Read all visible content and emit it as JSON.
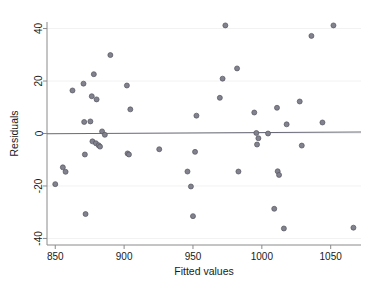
{
  "chart_data": {
    "type": "scatter",
    "title": "",
    "xlabel": "Fitted values",
    "ylabel": "Residuals",
    "xlim": [
      844,
      1072
    ],
    "ylim": [
      -42.5,
      42.5
    ],
    "xticks": [
      850,
      900,
      950,
      1000,
      1050
    ],
    "xtick_labels": [
      "850",
      "900",
      "950",
      "1000",
      "1050"
    ],
    "yticks": [
      -40,
      -20,
      0,
      20,
      40
    ],
    "ytick_labels": [
      "-40",
      "-20",
      "0",
      "20",
      "40"
    ],
    "grid": "faint horizontal gridlines at y ticks",
    "legend": "none",
    "reference_line": {
      "label": "zero residual line",
      "x_start": 844,
      "y_start": -0.1,
      "x_end": 1072,
      "y_end": 0.6
    },
    "marker_color": "#82828f",
    "marker_edge_color": "#55555f",
    "reference_line_color": "#6b6b78",
    "axis_color": "#8a8a8a",
    "background_color": "#ffffff",
    "n_points": 58,
    "points": [
      {
        "x": 850.0,
        "y": -19.3
      },
      {
        "x": 855.5,
        "y": -12.9
      },
      {
        "x": 857.5,
        "y": -14.6
      },
      {
        "x": 862.5,
        "y": 16.4
      },
      {
        "x": 870.5,
        "y": 19.0
      },
      {
        "x": 871.0,
        "y": 4.4
      },
      {
        "x": 871.5,
        "y": -8.0
      },
      {
        "x": 872.0,
        "y": -30.7
      },
      {
        "x": 875.5,
        "y": 4.6
      },
      {
        "x": 876.5,
        "y": 14.2
      },
      {
        "x": 877.0,
        "y": -3.0
      },
      {
        "x": 878.0,
        "y": 22.6
      },
      {
        "x": 879.5,
        "y": -3.7
      },
      {
        "x": 880.0,
        "y": 13.0
      },
      {
        "x": 881.5,
        "y": -4.5
      },
      {
        "x": 882.5,
        "y": -5.0
      },
      {
        "x": 884.0,
        "y": 0.8
      },
      {
        "x": 886.0,
        "y": -0.5
      },
      {
        "x": 890.0,
        "y": 29.9
      },
      {
        "x": 902.0,
        "y": 18.3
      },
      {
        "x": 902.5,
        "y": -7.6
      },
      {
        "x": 903.5,
        "y": -8.0
      },
      {
        "x": 904.5,
        "y": 9.2
      },
      {
        "x": 925.5,
        "y": -6.0
      },
      {
        "x": 946.0,
        "y": -14.5
      },
      {
        "x": 948.5,
        "y": -20.2
      },
      {
        "x": 950.0,
        "y": -31.5
      },
      {
        "x": 951.5,
        "y": -7.0
      },
      {
        "x": 952.5,
        "y": 6.8
      },
      {
        "x": 969.5,
        "y": 13.6
      },
      {
        "x": 971.5,
        "y": 20.9
      },
      {
        "x": 973.5,
        "y": 41.2
      },
      {
        "x": 982.0,
        "y": 24.8
      },
      {
        "x": 983.0,
        "y": -14.5
      },
      {
        "x": 994.5,
        "y": 8.0
      },
      {
        "x": 996.0,
        "y": 0.2
      },
      {
        "x": 996.5,
        "y": -4.2
      },
      {
        "x": 997.5,
        "y": -1.8
      },
      {
        "x": 1004.5,
        "y": 0.0
      },
      {
        "x": 1009.0,
        "y": -28.7
      },
      {
        "x": 1011.0,
        "y": 9.8
      },
      {
        "x": 1011.5,
        "y": -14.4
      },
      {
        "x": 1012.5,
        "y": -15.8
      },
      {
        "x": 1016.0,
        "y": -36.2
      },
      {
        "x": 1018.0,
        "y": 3.5
      },
      {
        "x": 1027.5,
        "y": 12.2
      },
      {
        "x": 1029.0,
        "y": -4.6
      },
      {
        "x": 1036.0,
        "y": 37.2
      },
      {
        "x": 1044.0,
        "y": 4.2
      },
      {
        "x": 1052.0,
        "y": 41.2
      },
      {
        "x": 1066.5,
        "y": -35.9
      }
    ]
  }
}
